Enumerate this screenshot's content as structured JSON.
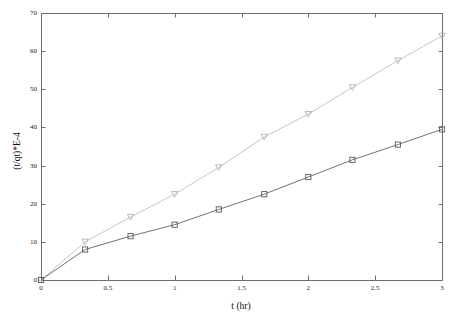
{
  "figure": {
    "background_color": "#ffffff",
    "plot_area": {
      "left": 41,
      "top": 13,
      "right": 442,
      "bottom": 280
    },
    "axis_color": "#6e6e6e",
    "text_color": "#111111"
  },
  "chart_data": {
    "type": "line",
    "title": "",
    "subtitle": "",
    "xlabel": "t (hr)",
    "ylabel": "(t/qt)*E-4",
    "xlim": [
      0,
      3
    ],
    "ylim": [
      0,
      70
    ],
    "grid": false,
    "legend": "none",
    "xticks": [
      "0",
      "0.5",
      "1",
      "1.5",
      "2",
      "2.5",
      "3"
    ],
    "xtick_values": [
      0,
      0.5,
      1,
      1.5,
      2,
      2.5,
      3
    ],
    "yticks": [
      "0",
      "10",
      "20",
      "30",
      "40",
      "50",
      "60",
      "70"
    ],
    "ytick_values": [
      0,
      10,
      20,
      30,
      40,
      50,
      60,
      70
    ],
    "x": [
      0,
      0.33,
      0.67,
      1,
      1.33,
      1.67,
      2,
      2.33,
      2.67,
      3
    ],
    "series": [
      {
        "name": "series-upper",
        "marker": "triangle-down",
        "color": "#b9b9b9",
        "marker_color": "#a8a8a8",
        "line_width": 0.8,
        "values": [
          0,
          10,
          16.5,
          22.5,
          29.5,
          37.5,
          43.5,
          50.5,
          57.5,
          64
        ]
      },
      {
        "name": "series-lower",
        "marker": "square",
        "color": "#636363",
        "marker_color": "#5a5a5a",
        "line_width": 0.9,
        "values": [
          0,
          8,
          11.5,
          14.5,
          18.5,
          22.5,
          27,
          31.5,
          35.5,
          39.5
        ]
      }
    ]
  }
}
